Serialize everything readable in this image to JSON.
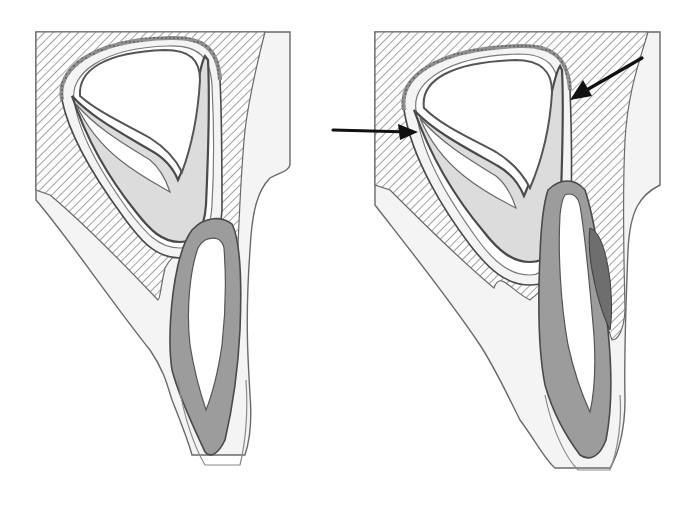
{
  "figure": {
    "width": 690,
    "height": 515,
    "background": "#ffffff",
    "colors": {
      "outline": "#6a6a6a",
      "dark_outline": "#3a3a3a",
      "hatch_line": "#8a8a8a",
      "soft_tissue": "#f4f4f4",
      "crypt_space": "#ffffff",
      "enamel_light": "#dcdcdc",
      "dentin_gray": "#9c9c9c",
      "dark_follicle": "#6e6e6e",
      "arrow": "#111111"
    },
    "panels": [
      {
        "id": "left",
        "label": "",
        "shapes": {
          "gingiva_outline": "M36,60 L36,200 C70,240 110,300 150,350 C165,372 168,388 172,400 C180,420 188,440 192,455 L245,455 C250,440 252,420 250,395 C248,360 245,320 250,250 C252,210 258,190 270,178 C280,172 288,172 290,165 L290,32 L36,32 Z",
          "bone_hatch": "M36,32 L265,32 C258,60 250,90 245,130 C240,180 238,240 236,300 C236,330 236,340 230,345 L222,340 C215,300 210,270 200,262 C180,252 175,250 165,268 C160,290 160,300 158,300 C120,260 80,220 50,195 L36,190 Z",
          "crypt_outer": "M62,100 C56,70 90,40 170,38 C205,37 218,50 220,80 C222,120 222,170 222,210 C220,245 205,258 180,258 C155,258 140,240 122,215 C100,185 70,140 62,100 Z",
          "crypt_space": "M74,100 C70,75 100,48 168,46 C200,45 210,58 212,85 C214,125 214,170 212,205 C210,238 198,248 180,248 C158,248 145,232 128,210 C108,182 80,140 74,100 Z",
          "enamel_organ": "M72,96 C92,118 125,135 150,150 C165,158 174,170 178,180 C185,165 192,140 196,100 C198,80 202,62 205,56 L208,60 C210,100 208,160 206,205 C204,232 195,242 180,242 C162,242 150,230 136,212 C115,186 90,150 72,96 Z",
          "enamel_cusp_left": "M76,104 C96,128 126,145 150,160 C160,168 166,180 170,192 C160,186 140,176 120,160 C100,144 86,126 76,104 Z",
          "dental_papilla": "M80,96 C78,70 105,52 165,50 C190,50 200,60 200,80 C198,115 192,145 182,172 C176,160 166,148 150,138 C125,124 98,112 80,96 Z",
          "follicle_band": "M62,100 C56,70 90,40 170,38 C205,37 218,50 220,80",
          "primary_tooth_outer": "M192,230 C205,216 222,216 232,224 C240,240 242,280 240,330 C238,370 232,410 225,440 C218,455 210,458 205,452 C195,430 180,400 172,370 C168,345 170,300 178,265 C182,248 186,238 192,230 Z",
          "primary_tooth_pulp": "M205,240 C214,236 222,238 224,248 C226,275 226,310 222,345 C218,372 212,395 206,410 C200,392 194,370 190,345 C186,310 190,270 198,248 C200,244 202,242 205,240 Z",
          "primary_tooth_follicle": "M178,380 C184,420 196,450 205,465 L240,465 C246,440 248,410 246,380"
        },
        "arrows": []
      },
      {
        "id": "right",
        "label": "",
        "shapes": {
          "gingiva_outline": "M375,32 L375,205 C410,250 450,300 480,345 C495,368 505,390 520,420 C535,440 545,460 555,468 L610,468 C618,455 625,430 625,400 C624,360 626,300 628,250 C630,210 640,195 660,185 L660,32 Z",
          "bone_hatch": "M375,32 L648,32 C640,60 628,90 625,140 C622,200 624,260 625,310 C624,330 618,340 612,340 C605,320 600,300 595,290 L590,225 C560,280 540,290 530,300 C510,290 500,270 494,288 C460,260 420,220 390,190 L375,185 Z",
          "crypt_outer": "M404,110 C398,75 440,48 520,46 C555,45 568,60 570,90 C572,140 572,190 570,230 C568,268 552,285 530,285 C505,285 488,268 470,245 C445,212 412,160 404,110 Z",
          "crypt_space": "M416,110 C412,82 448,56 518,54 C548,54 558,66 560,94 C562,140 562,188 560,225 C558,258 546,275 530,275 C510,275 494,262 478,240 C455,208 422,160 416,110 Z",
          "enamel_organ": "M414,110 C434,132 470,150 498,166 C512,174 520,186 524,196 C532,178 540,150 548,110 C552,90 556,72 560,66 L562,70 C564,110 562,170 560,220 C558,250 548,262 530,262 C512,262 498,250 484,232 C462,206 434,166 414,110 Z",
          "enamel_cusp_left": "M420,118 C440,142 470,160 496,176 C506,184 512,196 516,208 C504,202 484,192 464,176 C444,160 430,142 420,118 Z",
          "dental_papilla": "M424,108 C420,80 452,62 515,60 C542,60 552,72 552,92 C550,128 542,160 530,188 C524,176 512,162 496,152 C470,138 442,126 424,108 Z",
          "follicle_band": "M404,110 C398,75 440,48 520,46 C555,45 568,60 570,90",
          "primary_tooth_outer": "M548,190 C560,178 575,178 585,190 C595,220 602,270 608,330 C612,370 612,410 606,440 C600,456 590,462 580,455 C565,435 552,410 545,385 C538,350 538,300 540,255 C541,225 543,205 548,190 Z",
          "primary_tooth_pulp": "M565,195 C572,192 578,196 580,206 C586,240 590,290 594,335 C596,370 594,395 590,412 C582,395 574,372 568,345 C560,300 558,250 560,215 C561,205 562,199 565,195 Z",
          "dark_resorption": "M590,228 C600,232 606,250 610,280 C612,300 612,318 610,330 C604,318 598,300 594,280 C590,262 588,244 590,228 Z",
          "primary_tooth_follicle": "M545,395 C552,430 566,458 578,470 L610,470 C618,450 622,420 620,395"
        },
        "arrows": [
          {
            "name": "arrow-left-pointer",
            "x1": 333,
            "y1": 130,
            "x2": 418,
            "y2": 132,
            "head": "418,132 398,124 400,140"
          },
          {
            "name": "arrow-right-pointer",
            "x1": 642,
            "y1": 58,
            "x2": 570,
            "y2": 100,
            "head": "570,100 583,80 592,96"
          }
        ]
      }
    ]
  }
}
